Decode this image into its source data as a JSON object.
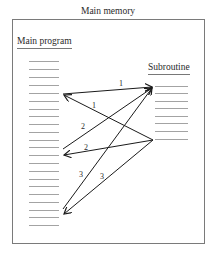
{
  "title": "Main memory",
  "main_program": {
    "label": "Main program",
    "line_count": 22
  },
  "subroutine": {
    "label": "Subroutine",
    "line_count": 8
  },
  "calls": [
    {
      "label": "1",
      "direction": "call"
    },
    {
      "label": "1",
      "direction": "return"
    },
    {
      "label": "2",
      "direction": "call"
    },
    {
      "label": "2",
      "direction": "return"
    },
    {
      "label": "3",
      "direction": "call"
    },
    {
      "label": "3",
      "direction": "return"
    }
  ],
  "colors": {
    "border": "#7a7a7a",
    "line": "#8c8c8c",
    "arrow": "#1a1a1a",
    "text": "#2a2a2a"
  }
}
